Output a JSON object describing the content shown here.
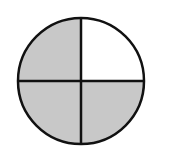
{
  "diagram": {
    "type": "fraction-circle",
    "total_parts": 4,
    "shaded_parts": 3,
    "unshaded_part": "top-right",
    "colors": {
      "shaded": "#c8c8c8",
      "unshaded": "#ffffff",
      "stroke": "#111111"
    }
  }
}
